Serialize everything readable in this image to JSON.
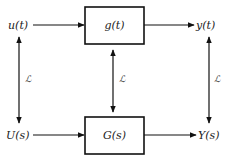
{
  "diagram": {
    "type": "block-diagram",
    "top": {
      "input": "u(t)",
      "block": "g(t)",
      "output": "y(t)"
    },
    "bottom": {
      "input": "U(s)",
      "block": "G(s)",
      "output": "Y(s)"
    },
    "transform_labels": {
      "left": "ℒ",
      "middle": "ℒ",
      "right": "ℒ"
    },
    "colors": {
      "line": "#111111",
      "background": "#ffffff"
    }
  }
}
